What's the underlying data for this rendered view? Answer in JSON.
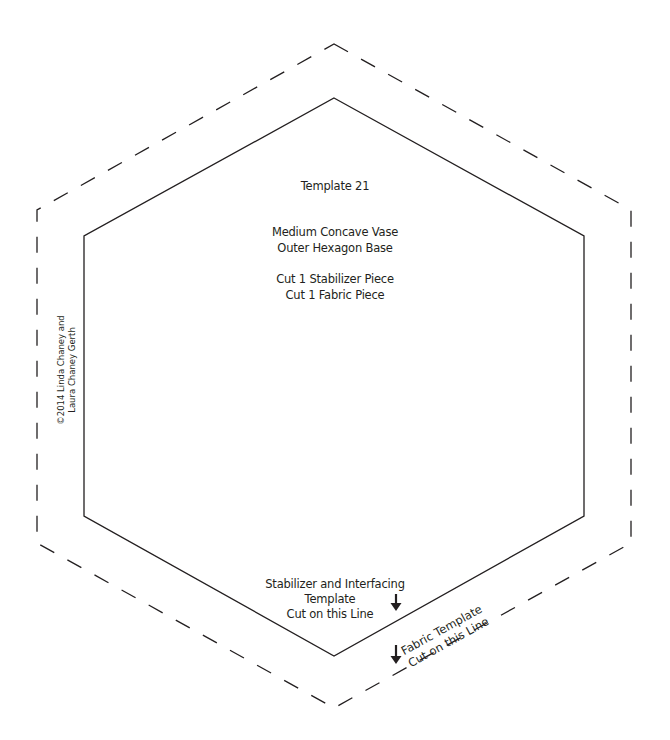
{
  "template": {
    "title": "Template 21",
    "name_line1": "Medium Concave Vase",
    "name_line2": "Outer Hexagon Base",
    "cut_line1": "Cut 1 Stabilizer Piece",
    "cut_line2": "Cut 1 Fabric Piece"
  },
  "copyright": {
    "line1": "©2014 Linda Chaney and",
    "line2": "Laura Chaney Gerth"
  },
  "stabilizer_label": {
    "line1": "Stabilizer and Interfacing",
    "line2": "Template",
    "line3": "Cut on this Line",
    "icon": "arrow-down-icon"
  },
  "fabric_label": {
    "line1": "Fabric Template",
    "line2": "Cut on this Line",
    "icon": "arrow-down-icon"
  },
  "shapes": {
    "inner_hexagon": {
      "style": "solid",
      "points": "334,98 584,236 584,516 334,656 84,516 84,236",
      "stroke": "#231f20"
    },
    "outer_hexagon": {
      "style": "dashed",
      "points": "334,44 631,210 631,543 334,708 37,543 37,210",
      "stroke": "#231f20",
      "dash": "16 15"
    }
  }
}
